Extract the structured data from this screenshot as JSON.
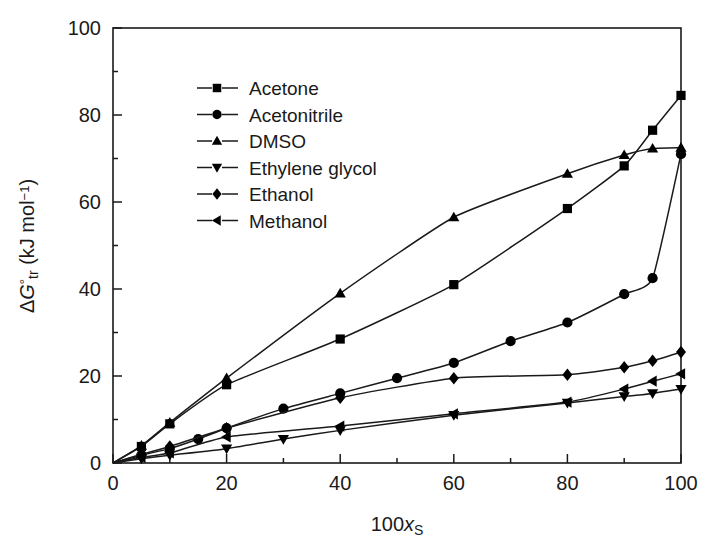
{
  "chart_data": {
    "type": "line",
    "title": "",
    "xlabel": "100x_s",
    "xlabel_parts": {
      "prefix": "100",
      "italic": "x",
      "sub": "S"
    },
    "ylabel": "ΔG°tr (kJ mol⁻¹)",
    "ylabel_parts": {
      "delta": "Δ",
      "italic": "G",
      "sup": "°",
      "sub": "tr",
      "unit": " (kJ mol",
      "unit_sup": "−1",
      "unit_close": ")"
    },
    "xlim": [
      0,
      100
    ],
    "ylim": [
      0,
      100
    ],
    "xticks": [
      0,
      20,
      40,
      60,
      80,
      100
    ],
    "yticks": [
      0,
      20,
      40,
      60,
      80,
      100
    ],
    "xticks_minor": [
      10,
      30,
      50,
      70,
      90
    ],
    "yticks_minor": [
      10,
      30,
      50,
      70,
      90
    ],
    "grid": false,
    "legend_position": "upper-left-inside",
    "series": [
      {
        "name": "Acetone",
        "marker": "square",
        "x": [
          0,
          5,
          10,
          20,
          40,
          60,
          80,
          90,
          95,
          100
        ],
        "values": [
          0,
          3.8,
          9.0,
          18.0,
          28.5,
          41.0,
          58.5,
          68.3,
          76.5,
          84.5
        ]
      },
      {
        "name": "Acetonitrile",
        "marker": "circle",
        "x": [
          0,
          5,
          10,
          15,
          20,
          30,
          40,
          50,
          60,
          70,
          80,
          90,
          95,
          100
        ],
        "values": [
          0,
          1.8,
          3.3,
          5.5,
          8.0,
          12.5,
          16.0,
          19.5,
          23.0,
          28.0,
          32.3,
          38.8,
          42.5,
          71.0
        ]
      },
      {
        "name": "DMSO",
        "marker": "triangle-up",
        "x": [
          0,
          5,
          10,
          20,
          40,
          60,
          80,
          90,
          95,
          100
        ],
        "values": [
          0,
          4.0,
          9.3,
          19.5,
          39.0,
          56.5,
          66.5,
          70.8,
          72.3,
          72.5
        ]
      },
      {
        "name": "Ethylene glycol",
        "marker": "triangle-down",
        "x": [
          0,
          5,
          10,
          20,
          30,
          40,
          60,
          80,
          90,
          95,
          100
        ],
        "values": [
          0,
          1.0,
          1.8,
          3.3,
          5.5,
          7.5,
          11.0,
          13.8,
          15.3,
          16.0,
          17.0
        ]
      },
      {
        "name": "Ethanol",
        "marker": "diamond",
        "x": [
          0,
          5,
          10,
          20,
          40,
          60,
          80,
          90,
          95,
          100
        ],
        "values": [
          0,
          2.0,
          3.8,
          8.0,
          15.0,
          19.5,
          20.3,
          22.0,
          23.5,
          25.5
        ]
      },
      {
        "name": "Methanol",
        "marker": "triangle-left",
        "x": [
          0,
          5,
          10,
          20,
          40,
          60,
          80,
          90,
          95,
          100
        ],
        "values": [
          0,
          1.3,
          2.3,
          6.0,
          8.5,
          11.3,
          14.0,
          17.0,
          18.8,
          20.5
        ]
      }
    ]
  },
  "legend": {
    "items": [
      {
        "label": "Acetone"
      },
      {
        "label": "Acetonitrile"
      },
      {
        "label": "DMSO"
      },
      {
        "label": "Ethylene glycol"
      },
      {
        "label": "Ethanol"
      },
      {
        "label": "Methanol"
      }
    ]
  },
  "axis": {
    "x_tick_labels": [
      "0",
      "20",
      "40",
      "60",
      "80",
      "100"
    ],
    "y_tick_labels": [
      "0",
      "20",
      "40",
      "60",
      "80",
      "100"
    ]
  },
  "colors": {
    "ink": "#1a1a1a",
    "marker": "#000000",
    "background": "#ffffff"
  }
}
